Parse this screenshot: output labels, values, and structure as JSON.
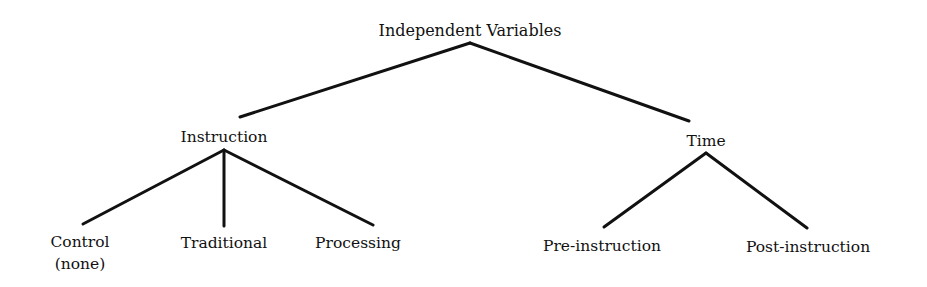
{
  "diagram": {
    "type": "tree",
    "root": {
      "label": "Independent Variables"
    },
    "branches": [
      {
        "label": "Instruction",
        "children": [
          {
            "label": "Control",
            "sublabel": "(none)"
          },
          {
            "label": "Traditional"
          },
          {
            "label": "Processing"
          }
        ]
      },
      {
        "label": "Time",
        "children": [
          {
            "label": "Pre-instruction"
          },
          {
            "label": "Post-instruction"
          }
        ]
      }
    ],
    "line_color": "#111111",
    "text_color": "#111111",
    "background": "#ffffff"
  }
}
